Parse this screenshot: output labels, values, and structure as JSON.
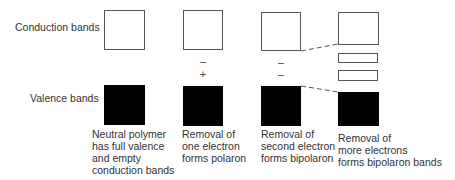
{
  "labels": {
    "conduction": "Conduction bands",
    "valence": "Valence bands"
  },
  "stages": [
    {
      "caption": "Neutral polymer\nhas full valence\nand empty\nconduction bands",
      "signs": []
    },
    {
      "caption": "Removal of\none electron\nforms polaron",
      "signs": [
        "–",
        "+"
      ]
    },
    {
      "caption": "Removal of\nsecond electron\nforms bipolaron",
      "signs": [
        "–",
        "–"
      ]
    },
    {
      "caption": "Removal of\nmore electrons\nforms bipolaron bands",
      "signs": []
    }
  ],
  "colors": {
    "valence_fill": "#000000",
    "conduction_border": "#555555"
  }
}
